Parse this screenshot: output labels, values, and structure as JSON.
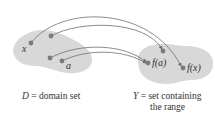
{
  "diagram": {
    "type": "function-mapping",
    "colors": {
      "blob": "#d8d8d8",
      "dot": "#7a7a7a",
      "arrow": "#6e6e6e",
      "text": "#333333"
    },
    "domain": {
      "caption": "D = domain set",
      "caption_symbol": "D",
      "caption_rest": " = domain set",
      "points": [
        {
          "id": "x",
          "label": "x"
        },
        {
          "id": "p2",
          "label": ""
        },
        {
          "id": "p3",
          "label": ""
        },
        {
          "id": "a",
          "label": "a"
        }
      ]
    },
    "codomain": {
      "caption_line1": "Y = set containing",
      "caption_symbol": "Y",
      "caption_line1_rest": " = set containing",
      "caption_line2": "the range",
      "points": [
        {
          "id": "fa",
          "label": "f(a)"
        },
        {
          "id": "q2",
          "label": ""
        },
        {
          "id": "fx",
          "label": "f(x)"
        }
      ]
    },
    "mappings": [
      {
        "from": "x",
        "to": "fx"
      },
      {
        "from": "p2",
        "to": "q2"
      },
      {
        "from": "p3",
        "to": "fa"
      },
      {
        "from": "a",
        "to": "fa"
      }
    ]
  }
}
